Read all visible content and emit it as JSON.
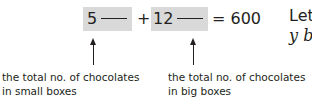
{
  "equation": {
    "term1_coef": "5",
    "plus": "+",
    "term2_coef": "12",
    "equals": "= 600"
  },
  "labels": {
    "left_line1": "the total no. of chocolates",
    "left_line2": "in small boxes",
    "right_line1": "the total no. of chocolates",
    "right_line2": "in big boxes"
  },
  "side_text": {
    "line1": "Let",
    "line2": "y b"
  },
  "colors": {
    "box_fill": "#d9d9d9",
    "text": "#231f20"
  }
}
